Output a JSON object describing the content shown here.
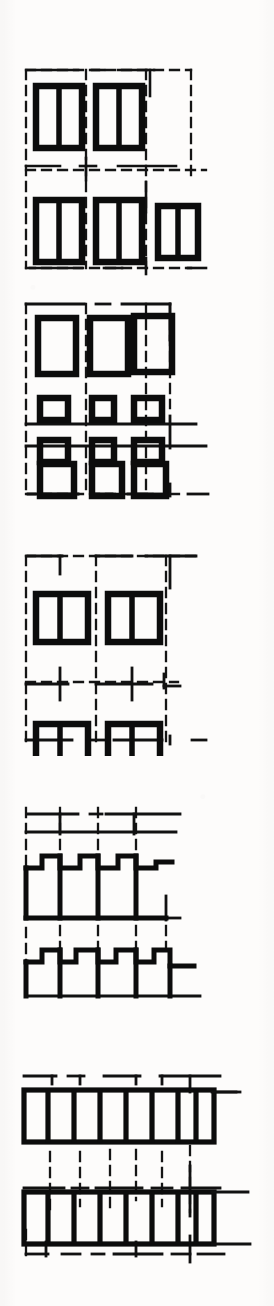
{
  "document": {
    "title": "Pattern Plate",
    "background_color": "#fdfcfb",
    "ink_color": "#101010",
    "guide_color": "#1a1a1a",
    "page_width": 274,
    "page_height": 1306,
    "caption": "",
    "panel_count": 5
  },
  "panels": [
    {
      "id": "panel-1",
      "name": "two-row-split-rectangle-motif",
      "label": "Figure 1",
      "y": 62,
      "height": 218,
      "grid": {
        "x": 26,
        "y": 8,
        "width": 165,
        "height": 198,
        "columns": 3,
        "rows": 2,
        "dash": "8 6",
        "stroke_width": 2.2
      },
      "motif": {
        "type": "split-rectangle",
        "divisions": 2,
        "orientation": "vertical",
        "border_width": 6,
        "fill": "none"
      },
      "cells": [
        {
          "row": 0,
          "col": 0,
          "filled": true,
          "w": 46,
          "h": 62
        },
        {
          "row": 0,
          "col": 1,
          "filled": true,
          "w": 46,
          "h": 62
        },
        {
          "row": 0,
          "col": 2,
          "filled": false,
          "w": 0,
          "h": 0
        },
        {
          "row": 1,
          "col": 0,
          "filled": true,
          "w": 46,
          "h": 62
        },
        {
          "row": 1,
          "col": 1,
          "filled": true,
          "w": 46,
          "h": 62
        },
        {
          "row": 1,
          "col": 2,
          "filled": true,
          "w": 40,
          "h": 52
        }
      ]
    },
    {
      "id": "panel-2",
      "name": "four-row-graduated-rectangle-motif",
      "label": "Figure 2",
      "y": 298,
      "height": 212,
      "grid": {
        "x": 26,
        "y": 6,
        "width": 165,
        "height": 196,
        "columns": 3,
        "rows": 4,
        "dash": "8 6",
        "stroke_width": 2.2
      },
      "motif": {
        "type": "open-rectangle",
        "divisions": 1,
        "orientation": "vertical",
        "border_width": 6,
        "fill": "none"
      },
      "cells": [
        {
          "row": 0,
          "col": 0,
          "filled": true,
          "w": 38,
          "h": 56
        },
        {
          "row": 0,
          "col": 1,
          "filled": true,
          "w": 38,
          "h": 56
        },
        {
          "row": 0,
          "col": 2,
          "filled": true,
          "w": 38,
          "h": 56
        },
        {
          "row": 1,
          "col": 0,
          "filled": true,
          "w": 28,
          "h": 22
        },
        {
          "row": 1,
          "col": 1,
          "filled": true,
          "w": 28,
          "h": 22
        },
        {
          "row": 1,
          "col": 2,
          "filled": true,
          "w": 28,
          "h": 22
        },
        {
          "row": 2,
          "col": 0,
          "filled": true,
          "w": 28,
          "h": 22
        },
        {
          "row": 2,
          "col": 1,
          "filled": true,
          "w": 28,
          "h": 22
        },
        {
          "row": 2,
          "col": 2,
          "filled": true,
          "w": 28,
          "h": 22
        },
        {
          "row": 3,
          "col": 0,
          "filled": true,
          "w": 34,
          "h": 46
        },
        {
          "row": 3,
          "col": 1,
          "filled": true,
          "w": 34,
          "h": 46
        },
        {
          "row": 3,
          "col": 2,
          "filled": true,
          "w": 34,
          "h": 46
        }
      ]
    },
    {
      "id": "panel-3",
      "name": "two-by-two-split-square-motif",
      "label": "Figure 3",
      "y": 548,
      "height": 208,
      "grid": {
        "x": 26,
        "y": 8,
        "width": 165,
        "height": 188,
        "columns": 3,
        "rows": 2,
        "dash": "8 6",
        "stroke_width": 2.2
      },
      "motif": {
        "type": "split-square",
        "divisions": 2,
        "orientation": "vertical",
        "border_width": 6,
        "fill": "none"
      },
      "cells": [
        {
          "row": 0,
          "col": 0,
          "filled": true,
          "w": 52,
          "h": 48
        },
        {
          "row": 0,
          "col": 1,
          "filled": true,
          "w": 52,
          "h": 48
        },
        {
          "row": 0,
          "col": 2,
          "filled": false,
          "w": 0,
          "h": 0
        },
        {
          "row": 1,
          "col": 0,
          "filled": true,
          "w": 52,
          "h": 48
        },
        {
          "row": 1,
          "col": 1,
          "filled": true,
          "w": 52,
          "h": 48
        },
        {
          "row": 1,
          "col": 2,
          "filled": false,
          "w": 0,
          "h": 0
        }
      ]
    },
    {
      "id": "panel-4",
      "name": "stepped-crenellation-motif",
      "label": "Figure 4",
      "y": 800,
      "height": 208,
      "grid": {
        "x": 26,
        "y": 6,
        "width": 165,
        "height": 196,
        "columns": 3,
        "rows": 2,
        "dash": "8 6",
        "stroke_width": 2.2
      },
      "motif": {
        "type": "stepped-profile",
        "steps_upper": 4,
        "steps_lower": 5,
        "border_width": 4,
        "fill": "none"
      },
      "rows": [
        {
          "index": 0,
          "step_count": 4,
          "direction": "descending-right",
          "unit_width": 38,
          "unit_height": 58
        },
        {
          "index": 1,
          "step_count": 5,
          "direction": "descending-right",
          "unit_width": 32,
          "unit_height": 48
        }
      ]
    },
    {
      "id": "panel-5",
      "name": "comb-band-motif",
      "label": "Figure 5",
      "y": 1040,
      "height": 228,
      "grid": {
        "x": 26,
        "y": 6,
        "width": 175,
        "height": 212,
        "columns": 4,
        "rows": 3,
        "dash": "8 6",
        "stroke_width": 2.2
      },
      "motif": {
        "type": "comb-band",
        "teeth": 7,
        "border_width": 4.5,
        "fill": "none"
      },
      "bands": [
        {
          "index": 0,
          "teeth": 7,
          "width": 160,
          "height": 56
        },
        {
          "index": 1,
          "teeth": 7,
          "width": 160,
          "height": 56
        }
      ]
    }
  ],
  "footer": {
    "text": ""
  }
}
